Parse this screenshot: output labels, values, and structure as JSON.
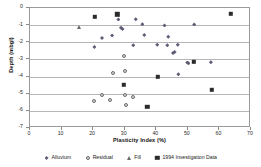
{
  "chart_data": {
    "type": "scatter",
    "title": "",
    "xlabel": "Plasticity Index (%)",
    "ylabel": "Depth (mbgl)",
    "xlim": [
      0,
      70
    ],
    "ylim": [
      -7,
      0
    ],
    "xticks": [
      0,
      10,
      20,
      30,
      40,
      50,
      60,
      70
    ],
    "yticks": [
      0,
      -1,
      -2,
      -3,
      -4,
      -5,
      -6,
      -7
    ],
    "grid": "horizontal",
    "legend_position": "bottom",
    "series": [
      {
        "name": "Alluvium",
        "marker": "diamond",
        "color": "#5d5d77",
        "points": [
          [
            20.4,
            -2.28
          ],
          [
            22.8,
            -1.75
          ],
          [
            26.0,
            -1.6
          ],
          [
            28.8,
            -1.15
          ],
          [
            29.3,
            -1.22
          ],
          [
            28.0,
            -0.67
          ],
          [
            32.7,
            -2.18
          ],
          [
            33.5,
            -0.66
          ],
          [
            35.6,
            -0.95
          ],
          [
            36.2,
            -1.57
          ],
          [
            40.3,
            -2.15
          ],
          [
            42.6,
            -1.02
          ],
          [
            43.8,
            -1.67
          ],
          [
            43.5,
            -2.18
          ],
          [
            45.3,
            -2.62
          ],
          [
            45.8,
            -2.57
          ],
          [
            46.8,
            -2.15
          ],
          [
            47.0,
            -3.87
          ],
          [
            49.8,
            -3.18
          ],
          [
            50.2,
            -3.22
          ],
          [
            52.0,
            -0.96
          ],
          [
            57.3,
            -3.17
          ]
        ]
      },
      {
        "name": "Residual",
        "marker": "circle",
        "color": "#6b6b6b",
        "points": [
          [
            20.2,
            -5.42
          ],
          [
            22.8,
            -5.08
          ],
          [
            25.4,
            -5.35
          ],
          [
            26.2,
            -3.77
          ],
          [
            30.0,
            -3.7
          ],
          [
            30.2,
            -5.05
          ],
          [
            30.4,
            -5.68
          ],
          [
            32.6,
            -5.18
          ],
          [
            29.8,
            -2.78
          ]
        ]
      },
      {
        "name": "Fill",
        "marker": "triangle",
        "color": "#6a6a6a",
        "points": [
          [
            15.4,
            -1.1
          ]
        ]
      },
      {
        "name": "1994 Investigation Data",
        "marker": "square",
        "color": "#2b2b2b",
        "points": [
          [
            20.6,
            -0.5
          ],
          [
            27.7,
            -0.36
          ],
          [
            29.8,
            -4.47
          ],
          [
            37.2,
            -5.78
          ],
          [
            40.4,
            -4.0
          ],
          [
            51.8,
            -3.13
          ],
          [
            57.5,
            -4.78
          ],
          [
            63.6,
            -0.35
          ]
        ]
      }
    ]
  },
  "axis": {
    "x_tick_labels": [
      "0",
      "10",
      "20",
      "30",
      "40",
      "50",
      "60",
      "70"
    ],
    "y_tick_labels": [
      "0",
      "-1",
      "-2",
      "-3",
      "-4",
      "-5",
      "-6",
      "-7"
    ]
  },
  "legend": {
    "items": [
      {
        "label": "Alluvium",
        "marker": "diamond"
      },
      {
        "label": "Residual",
        "marker": "circle"
      },
      {
        "label": "Fill",
        "marker": "triangle"
      },
      {
        "label": "1994 Investigation Data",
        "marker": "square"
      }
    ]
  }
}
